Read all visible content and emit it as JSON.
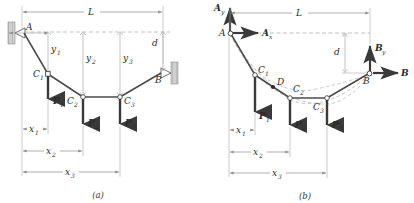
{
  "figure": {
    "type": "engineering-diagram",
    "background": "#ffffff",
    "ink": "#3a3a3a",
    "member_color": "#4a4a4a",
    "thin_color": "#8d8d8d",
    "dashed_color": "#a8a8a8"
  },
  "panels": [
    {
      "id": "a",
      "caption": "(a)",
      "labels": {
        "support_a": "A",
        "support_b": "B",
        "span": "L",
        "sag": "d",
        "node1": "C",
        "node1_sub": "1",
        "node2": "C",
        "node2_sub": "2",
        "node3": "C",
        "node3_sub": "3",
        "load1": "P",
        "load1_sub": "1",
        "load2": "P",
        "load2_sub": "2",
        "load3": "P",
        "load3_sub": "3",
        "y1": "y",
        "y1_sub": "1",
        "y2": "y",
        "y2_sub": "2",
        "y3": "y",
        "y3_sub": "3",
        "x1": "x",
        "x1_sub": "1",
        "x2": "x",
        "x2_sub": "2",
        "x3": "x",
        "x3_sub": "3"
      }
    },
    {
      "id": "b",
      "caption": "(b)",
      "labels": {
        "support_a": "A",
        "support_b": "B",
        "span": "L",
        "sag": "d",
        "reaction_ax": "A",
        "reaction_ax_sub": "x",
        "reaction_ay": "A",
        "reaction_ay_sub": "y",
        "reaction_bx": "B",
        "reaction_by": "B",
        "reaction_by_sub": "y",
        "node1": "C",
        "node1_sub": "1",
        "node2": "C",
        "node2_sub": "2",
        "node3": "C",
        "node3_sub": "3",
        "point_d": "D",
        "load1": "P",
        "load1_sub": "1",
        "load2": "P",
        "load2_sub": "2",
        "load3": "P",
        "load3_sub": "3",
        "x1": "x",
        "x1_sub": "1",
        "x2": "x",
        "x2_sub": "2",
        "x3": "x",
        "x3_sub": "3"
      }
    }
  ],
  "geometry": {
    "panel_a": {
      "A": [
        22,
        32
      ],
      "C1": [
        48,
        74
      ],
      "C2": [
        83,
        97
      ],
      "C3": [
        120,
        97
      ],
      "B": [
        163,
        72
      ],
      "dim_L_y": 12,
      "dim_x1_y": 129,
      "dim_x2_y": 151,
      "dim_x3_y": 172
    },
    "panel_b": {
      "A": [
        229,
        33
      ],
      "C1": [
        255,
        75
      ],
      "C2": [
        290,
        98
      ],
      "C3": [
        327,
        98
      ],
      "B": [
        370,
        73
      ],
      "D": [
        273,
        87
      ],
      "dim_L_y": 13,
      "dim_x1_y": 130,
      "dim_x2_y": 152,
      "dim_x3_y": 173
    }
  }
}
